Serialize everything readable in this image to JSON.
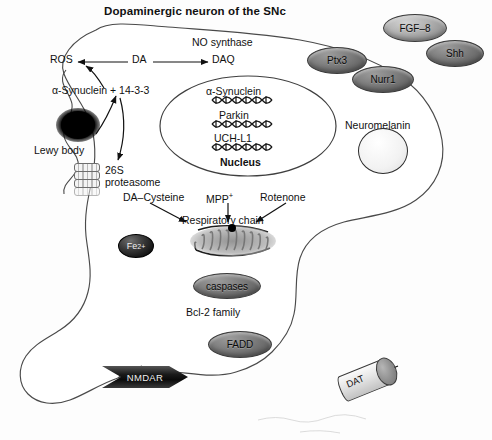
{
  "figure": {
    "title": "Dopaminergic neuron of the SNc",
    "width": 492,
    "height": 440
  },
  "labels": {
    "no_synthase": "NO synthase",
    "ros": "ROS",
    "da": "DA",
    "daq": "DAQ",
    "alpha_syn_1433": "α-Synuclein + 14-3-3",
    "lewy_body": "Lewy body",
    "proteasome_line1": "26S",
    "proteasome_line2": "proteasome",
    "da_cysteine": "DA–Cysteine",
    "mpp": "MPP",
    "mpp_sup": "+",
    "rotenone": "Rotenone",
    "respiratory_chain": "Respiratory chain",
    "fe_ion": "Fe",
    "fe_ion_sup": "2+",
    "bcl2_family": "Bcl-2 family",
    "neuromelanin": "Neuromelanin"
  },
  "nucleus": {
    "label": "Nucleus",
    "genes": [
      "α-Synuclein",
      "Parkin",
      "UCH-L1"
    ]
  },
  "badges": [
    {
      "id": "fgf8",
      "label": "FGF–8",
      "x": 383,
      "y": 14,
      "w": 62,
      "h": 26,
      "tone": "light"
    },
    {
      "id": "shh",
      "label": "Shh",
      "x": 426,
      "y": 40,
      "w": 56,
      "h": 25,
      "tone": "dark"
    },
    {
      "id": "ptx3",
      "label": "Ptx3",
      "x": 307,
      "y": 47,
      "w": 58,
      "h": 25,
      "tone": "dark"
    },
    {
      "id": "nurr1",
      "label": "Nurr1",
      "x": 352,
      "y": 66,
      "w": 60,
      "h": 25,
      "tone": "dark"
    },
    {
      "id": "caspases",
      "label": "caspases",
      "x": 193,
      "y": 273,
      "w": 66,
      "h": 24,
      "tone": "dark"
    },
    {
      "id": "fadd",
      "label": "FADD",
      "x": 208,
      "y": 331,
      "w": 62,
      "h": 25,
      "tone": "dark"
    }
  ],
  "membrane_proteins": {
    "nmdar": "NMDAR",
    "dat": "DAT"
  },
  "colors": {
    "ink": "#111111",
    "outline": "#444444",
    "badge_light": "#b0b0b0",
    "badge_dark": "#7a7a7a",
    "lewy_body": "#000000",
    "background": "#fdfdfd"
  }
}
